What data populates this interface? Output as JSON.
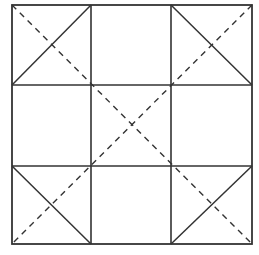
{
  "diagram": {
    "title": "",
    "stroke_color": "#333333",
    "background": "#ffffff",
    "outer_square": {
      "x1": 12,
      "y1": 5,
      "x2": 252,
      "y2": 244
    },
    "grid": {
      "vertical_x": [
        91,
        171
      ],
      "horizontal_y": [
        85,
        166
      ]
    },
    "solid_diagonals": [
      {
        "name": "top-left-cell-diagonal",
        "x1": 12,
        "y1": 85,
        "x2": 91,
        "y2": 5
      },
      {
        "name": "top-right-cell-diagonal",
        "x1": 171,
        "y1": 5,
        "x2": 252,
        "y2": 85
      },
      {
        "name": "bottom-left-cell-diagonal",
        "x1": 12,
        "y1": 166,
        "x2": 91,
        "y2": 244
      },
      {
        "name": "bottom-right-cell-diagonal",
        "x1": 171,
        "y1": 244,
        "x2": 252,
        "y2": 166
      }
    ],
    "dashed_diagonals": [
      {
        "name": "main-diagonal-dashed",
        "x1": 12,
        "y1": 5,
        "x2": 252,
        "y2": 244
      },
      {
        "name": "anti-diagonal-dashed",
        "x1": 252,
        "y1": 5,
        "x2": 12,
        "y2": 244
      }
    ]
  }
}
